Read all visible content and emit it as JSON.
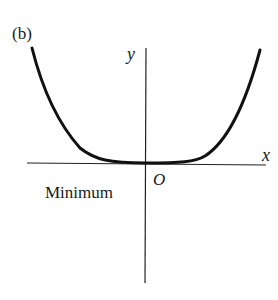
{
  "figure": {
    "panel_label": "(b)",
    "axis_x_label": "x",
    "axis_y_label": "y",
    "origin_label": "O",
    "annotation": "Minimum",
    "curve_description": "Even function with a flat minimum at the origin (e.g. y = x^4 shape)",
    "line_color": "#111111"
  }
}
